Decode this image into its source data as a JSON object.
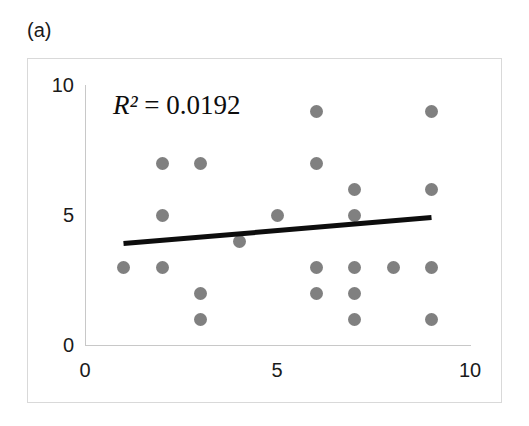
{
  "panel": {
    "label": "(a)"
  },
  "annotation": {
    "r_squared_variable": "R²",
    "r_squared_text": " = 0.0192",
    "r_squared_full": "R² = 0.0192",
    "r_squared_value": 0.0192
  },
  "axes": {
    "x_ticks": [
      "0",
      "5",
      "10"
    ],
    "y_ticks": [
      "10",
      "5",
      "0"
    ],
    "x_label": "",
    "y_label": ""
  },
  "colors": {
    "marker": "#808080",
    "trendline": "#0d0d0d",
    "axis": "#c8c8c8",
    "frame": "#d9d9d9",
    "text": "#1a1a1a",
    "background": "#ffffff"
  },
  "chart_data": {
    "type": "scatter",
    "title": "",
    "subtitle": "",
    "xlabel": "",
    "ylabel": "",
    "xlim": [
      0,
      10
    ],
    "ylim": [
      0,
      10
    ],
    "xticks": [
      0,
      5,
      10
    ],
    "yticks": [
      0,
      5,
      10
    ],
    "grid": false,
    "legend": null,
    "annotations": [
      {
        "text": "R² = 0.0192",
        "x": 2.0,
        "y": 9.3
      }
    ],
    "series": [
      {
        "name": "observations",
        "marker": "circle",
        "color": "#808080",
        "points": [
          {
            "x": 1,
            "y": 3
          },
          {
            "x": 2,
            "y": 7
          },
          {
            "x": 2,
            "y": 5
          },
          {
            "x": 2,
            "y": 3
          },
          {
            "x": 3,
            "y": 7
          },
          {
            "x": 3,
            "y": 2
          },
          {
            "x": 3,
            "y": 1
          },
          {
            "x": 4,
            "y": 4
          },
          {
            "x": 5,
            "y": 5
          },
          {
            "x": 6,
            "y": 9
          },
          {
            "x": 6,
            "y": 7
          },
          {
            "x": 6,
            "y": 3
          },
          {
            "x": 6,
            "y": 2
          },
          {
            "x": 7,
            "y": 6
          },
          {
            "x": 7,
            "y": 5
          },
          {
            "x": 7,
            "y": 3
          },
          {
            "x": 7,
            "y": 2
          },
          {
            "x": 7,
            "y": 1
          },
          {
            "x": 8,
            "y": 3
          },
          {
            "x": 9,
            "y": 9
          },
          {
            "x": 9,
            "y": 6
          },
          {
            "x": 9,
            "y": 3
          },
          {
            "x": 9,
            "y": 1
          }
        ]
      }
    ],
    "trendline": {
      "type": "linear",
      "color": "#0d0d0d",
      "width": 5,
      "x_start": 1.0,
      "y_start": 3.9,
      "x_end": 9.0,
      "y_end": 4.9,
      "r_squared": 0.0192
    }
  }
}
